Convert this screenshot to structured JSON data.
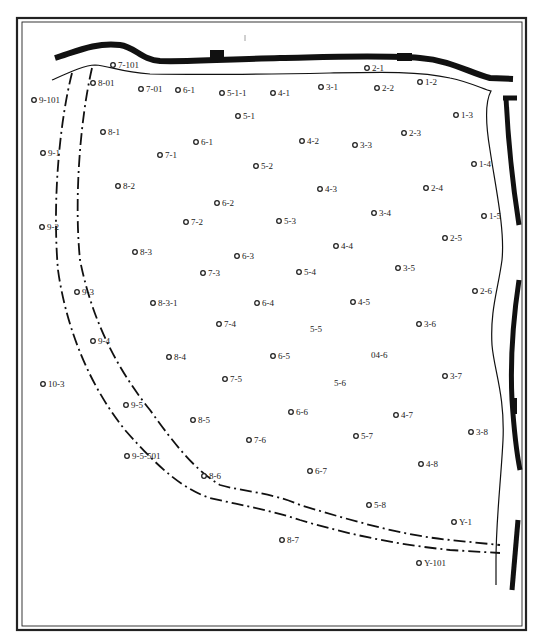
{
  "map": {
    "title": "",
    "coordinate_system": "map units: x 0-539 left-to-right, y 0-641 top-to-bottom (as scanned)",
    "wells": [
      {
        "id": "7-101",
        "x": 113,
        "y": 65,
        "labeled_marker": true
      },
      {
        "id": "8-01",
        "x": 93,
        "y": 83,
        "labeled_marker": true
      },
      {
        "id": "7-01",
        "x": 141,
        "y": 89,
        "labeled_marker": true
      },
      {
        "id": "6-1",
        "x": 178,
        "y": 90,
        "labeled_marker": true
      },
      {
        "id": "5-1-1",
        "x": 222,
        "y": 93,
        "labeled_marker": true
      },
      {
        "id": "4-1",
        "x": 273,
        "y": 93,
        "labeled_marker": true
      },
      {
        "id": "3-1",
        "x": 321,
        "y": 87,
        "labeled_marker": true
      },
      {
        "id": "2-1",
        "x": 367,
        "y": 68,
        "labeled_marker": true
      },
      {
        "id": "2-2",
        "x": 377,
        "y": 88,
        "labeled_marker": true
      },
      {
        "id": "1-2",
        "x": 420,
        "y": 82,
        "labeled_marker": true
      },
      {
        "id": "9-101",
        "x": 34,
        "y": 100,
        "labeled_marker": true
      },
      {
        "id": "5-1",
        "x": 238,
        "y": 116,
        "labeled_marker": true
      },
      {
        "id": "1-3",
        "x": 456,
        "y": 115,
        "labeled_marker": true
      },
      {
        "id": "8-1",
        "x": 103,
        "y": 132,
        "labeled_marker": true
      },
      {
        "id": "2-3",
        "x": 404,
        "y": 133,
        "labeled_marker": true
      },
      {
        "id": "6-1",
        "x": 196,
        "y": 142,
        "labeled_marker": true
      },
      {
        "id": "4-2",
        "x": 302,
        "y": 141,
        "labeled_marker": true
      },
      {
        "id": "3-3",
        "x": 355,
        "y": 145,
        "labeled_marker": true
      },
      {
        "id": "9-1",
        "x": 43,
        "y": 153,
        "labeled_marker": true
      },
      {
        "id": "7-1",
        "x": 160,
        "y": 155,
        "labeled_marker": true
      },
      {
        "id": "1-4",
        "x": 474,
        "y": 164,
        "labeled_marker": true
      },
      {
        "id": "5-2",
        "x": 256,
        "y": 166,
        "labeled_marker": true
      },
      {
        "id": "8-2",
        "x": 118,
        "y": 186,
        "labeled_marker": true
      },
      {
        "id": "4-3",
        "x": 320,
        "y": 189,
        "labeled_marker": true
      },
      {
        "id": "2-4",
        "x": 426,
        "y": 188,
        "labeled_marker": true
      },
      {
        "id": "6-2",
        "x": 217,
        "y": 203,
        "labeled_marker": true
      },
      {
        "id": "3-4",
        "x": 374,
        "y": 213,
        "labeled_marker": true
      },
      {
        "id": "1-5",
        "x": 484,
        "y": 216,
        "labeled_marker": true
      },
      {
        "id": "7-2",
        "x": 186,
        "y": 222,
        "labeled_marker": true
      },
      {
        "id": "5-3",
        "x": 279,
        "y": 221,
        "labeled_marker": true
      },
      {
        "id": "9-2",
        "x": 42,
        "y": 227,
        "labeled_marker": true
      },
      {
        "id": "2-5",
        "x": 445,
        "y": 238,
        "labeled_marker": true
      },
      {
        "id": "4-4",
        "x": 336,
        "y": 246,
        "labeled_marker": true
      },
      {
        "id": "8-3",
        "x": 135,
        "y": 252,
        "labeled_marker": true
      },
      {
        "id": "6-3",
        "x": 237,
        "y": 256,
        "labeled_marker": true
      },
      {
        "id": "5-4",
        "x": 299,
        "y": 272,
        "labeled_marker": true
      },
      {
        "id": "3-5",
        "x": 398,
        "y": 268,
        "labeled_marker": true
      },
      {
        "id": "7-3",
        "x": 203,
        "y": 273,
        "labeled_marker": true
      },
      {
        "id": "9-3",
        "x": 77,
        "y": 292,
        "labeled_marker": true
      },
      {
        "id": "2-6",
        "x": 475,
        "y": 291,
        "labeled_marker": true
      },
      {
        "id": "8-3-1",
        "x": 153,
        "y": 303,
        "labeled_marker": true
      },
      {
        "id": "6-4",
        "x": 257,
        "y": 303,
        "labeled_marker": true
      },
      {
        "id": "4-5",
        "x": 353,
        "y": 302,
        "labeled_marker": true
      },
      {
        "id": "7-4",
        "x": 219,
        "y": 324,
        "labeled_marker": true
      },
      {
        "id": "5-5",
        "x": 316,
        "y": 329,
        "labeled_marker": false
      },
      {
        "id": "3-6",
        "x": 419,
        "y": 324,
        "labeled_marker": true
      },
      {
        "id": "9-4",
        "x": 93,
        "y": 341,
        "labeled_marker": true
      },
      {
        "id": "8-4",
        "x": 169,
        "y": 357,
        "labeled_marker": true
      },
      {
        "id": "6-5",
        "x": 273,
        "y": 356,
        "labeled_marker": true
      },
      {
        "id": "04-6",
        "x": 377,
        "y": 355,
        "labeled_marker": false
      },
      {
        "id": "10-3",
        "x": 43,
        "y": 384,
        "labeled_marker": true
      },
      {
        "id": "7-5",
        "x": 225,
        "y": 379,
        "labeled_marker": true
      },
      {
        "id": "5-6",
        "x": 340,
        "y": 383,
        "labeled_marker": false
      },
      {
        "id": "3-7",
        "x": 445,
        "y": 376,
        "labeled_marker": true
      },
      {
        "id": "9-5",
        "x": 126,
        "y": 405,
        "labeled_marker": true
      },
      {
        "id": "6-6",
        "x": 291,
        "y": 412,
        "labeled_marker": true
      },
      {
        "id": "4-7",
        "x": 396,
        "y": 415,
        "labeled_marker": true
      },
      {
        "id": "8-5",
        "x": 193,
        "y": 420,
        "labeled_marker": true
      },
      {
        "id": "5-7",
        "x": 356,
        "y": 436,
        "labeled_marker": true
      },
      {
        "id": "3-8",
        "x": 471,
        "y": 432,
        "labeled_marker": true
      },
      {
        "id": "7-6",
        "x": 249,
        "y": 440,
        "labeled_marker": true
      },
      {
        "id": "9-5-501",
        "x": 127,
        "y": 456,
        "labeled_marker": true
      },
      {
        "id": "4-8",
        "x": 421,
        "y": 464,
        "labeled_marker": true
      },
      {
        "id": "6-7",
        "x": 310,
        "y": 471,
        "labeled_marker": true
      },
      {
        "id": "8-6",
        "x": 204,
        "y": 476,
        "labeled_marker": true
      },
      {
        "id": "5-8",
        "x": 369,
        "y": 505,
        "labeled_marker": true
      },
      {
        "id": "Y-1",
        "x": 454,
        "y": 522,
        "labeled_marker": true
      },
      {
        "id": "8-7",
        "x": 282,
        "y": 540,
        "labeled_marker": true
      },
      {
        "id": "Y-101",
        "x": 419,
        "y": 563,
        "labeled_marker": true
      }
    ]
  }
}
